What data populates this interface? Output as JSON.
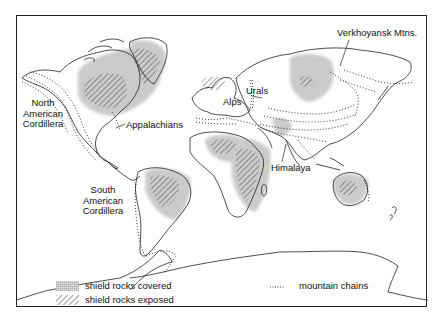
{
  "map": {
    "title": "",
    "labels": {
      "north_american_cordillera": [
        "North",
        "American",
        "Cordillera"
      ],
      "appalachians": "Appalachians",
      "south_american_cordillera": [
        "South",
        "American",
        "Cordillera"
      ],
      "alps": "Alps",
      "urals": "Urals",
      "himalaya": "Himalaya",
      "verkhoyansk": "Verkhoyansk Mtns."
    },
    "legend": {
      "covered": "shield rocks covered",
      "exposed": "shield rocks exposed",
      "mountains": "mountain chains"
    },
    "colors": {
      "land_outline": "#222222",
      "shield_covered": "#c8c8c8",
      "hatch": "#333333",
      "mountain_dots": "#222222",
      "background": "#ffffff"
    }
  }
}
